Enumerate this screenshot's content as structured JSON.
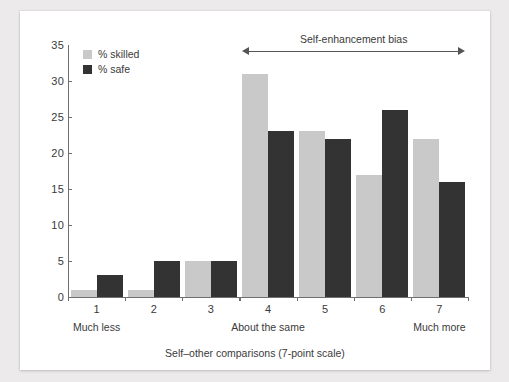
{
  "chart_data": {
    "type": "bar",
    "title": "",
    "xlabel": "Self–other comparisons (7-point scale)",
    "ylabel": "",
    "ylim": [
      0,
      35
    ],
    "yticks": [
      0,
      5,
      10,
      15,
      20,
      25,
      30,
      35
    ],
    "grid": false,
    "legend_position": "top-left",
    "categories": [
      "1",
      "2",
      "3",
      "4",
      "5",
      "6",
      "7"
    ],
    "series": [
      {
        "name": "% skilled",
        "color": "#c9c9c9",
        "values": [
          1,
          1,
          5,
          31,
          23,
          17,
          22
        ]
      },
      {
        "name": "% safe",
        "color": "#333333",
        "values": [
          3,
          5,
          5,
          23,
          22,
          26,
          16
        ]
      }
    ],
    "category_annotations": [
      {
        "category": "1",
        "label": "Much less"
      },
      {
        "category": "4",
        "label": "About the same"
      },
      {
        "category": "7",
        "label": "Much more"
      }
    ],
    "annotations": [
      {
        "text": "Self-enhancement bias",
        "type": "double-arrow",
        "from_category": "4",
        "to_category": "7"
      }
    ]
  },
  "colors": {
    "skilled": "#c9c9c9",
    "safe": "#333333",
    "axis": "#6f6f6f",
    "text": "#3a3a3a",
    "card": "#ffffff",
    "page_background": "#eceaea"
  }
}
